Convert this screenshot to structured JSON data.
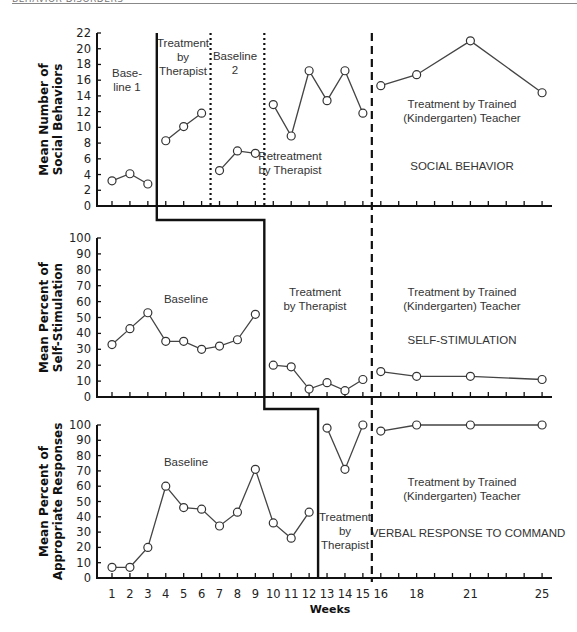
{
  "page": {
    "running_header": "BEHAVIOR DISORDERS"
  },
  "chart_data": {
    "type": "line",
    "layout": "multiple-baseline, three vertically stacked panels sharing the x-axis",
    "xlabel": "Weeks",
    "x_tick_labels": [
      "1",
      "2",
      "3",
      "4",
      "5",
      "6",
      "7",
      "8",
      "9",
      "10",
      "11",
      "12",
      "13",
      "14",
      "15",
      "16",
      "18",
      "21",
      "25"
    ],
    "x_range": [
      0,
      26
    ],
    "x_axis_ticks": [
      1,
      2,
      3,
      4,
      5,
      6,
      7,
      8,
      9,
      10,
      11,
      12,
      13,
      14,
      15,
      16,
      17,
      18,
      19,
      20,
      21,
      22,
      23,
      24,
      25
    ],
    "phase_change_week_dashed": 15.5,
    "panels": [
      {
        "id": "social",
        "ylabel": [
          "Mean Number of",
          "Social Behaviors"
        ],
        "ylim": [
          0,
          22
        ],
        "yticks": [
          0,
          2,
          4,
          6,
          8,
          10,
          12,
          14,
          16,
          18,
          20,
          22
        ],
        "panel_title": "SOCIAL BEHAVIOR",
        "segments": [
          {
            "x": [
              1,
              2,
              3
            ],
            "y": [
              3.2,
              4.1,
              2.8
            ]
          },
          {
            "x": [
              4,
              5,
              6
            ],
            "y": [
              8.3,
              10.1,
              11.8
            ]
          },
          {
            "x": [
              7,
              8,
              9
            ],
            "y": [
              4.5,
              7.0,
              6.7
            ]
          },
          {
            "x": [
              10,
              11,
              12,
              13,
              14,
              15
            ],
            "y": [
              12.9,
              8.9,
              17.2,
              13.4,
              17.2,
              11.8
            ]
          },
          {
            "x": [
              16,
              18,
              21,
              25
            ],
            "y": [
              15.3,
              16.7,
              21.0,
              14.4
            ]
          }
        ],
        "dotted_dividers_week": [
          6.5,
          9.5
        ],
        "phase_labels": [
          {
            "lines": [
              "Base-",
              "line 1"
            ]
          },
          {
            "lines": [
              "Treatment",
              "by",
              "Therapist"
            ]
          },
          {
            "lines": [
              "Baseline",
              "2"
            ]
          },
          {
            "lines": [
              "Retreatment",
              "by Therapist"
            ]
          },
          {
            "lines": [
              "Treatment by Trained",
              "(Kindergarten) Teacher"
            ]
          }
        ]
      },
      {
        "id": "selfstim",
        "ylabel": [
          "Mean Percent of",
          "Self-Stimulation"
        ],
        "ylim": [
          0,
          100
        ],
        "yticks": [
          0,
          10,
          20,
          30,
          40,
          50,
          60,
          70,
          80,
          90,
          100
        ],
        "panel_title": "SELF-STIMULATION",
        "segments": [
          {
            "x": [
              1,
              2,
              3,
              4,
              5,
              6,
              7,
              8,
              9
            ],
            "y": [
              33,
              43,
              53,
              35,
              35,
              30,
              32,
              36,
              52
            ]
          },
          {
            "x": [
              10,
              11,
              12,
              13,
              14,
              15
            ],
            "y": [
              20,
              19,
              5,
              9,
              4,
              11
            ]
          },
          {
            "x": [
              16,
              18,
              21,
              25
            ],
            "y": [
              16,
              13,
              13,
              11
            ]
          }
        ],
        "phase_labels": [
          {
            "lines": [
              "Baseline"
            ]
          },
          {
            "lines": [
              "Treatment",
              "by Therapist"
            ]
          },
          {
            "lines": [
              "Treatment by Trained",
              "(Kindergarten) Teacher"
            ]
          }
        ]
      },
      {
        "id": "verbal",
        "ylabel": [
          "Mean Percent of",
          "Appropriate Responses"
        ],
        "ylim": [
          0,
          100
        ],
        "yticks": [
          0,
          10,
          20,
          30,
          40,
          50,
          60,
          70,
          80,
          90,
          100
        ],
        "panel_title": "VERBAL RESPONSE TO COMMAND",
        "segments": [
          {
            "x": [
              1,
              2,
              3,
              4,
              5,
              6,
              7,
              8,
              9,
              10,
              11,
              12
            ],
            "y": [
              7,
              7,
              20,
              60,
              46,
              45,
              34,
              43,
              71,
              36,
              26,
              43
            ]
          },
          {
            "x": [
              13,
              14,
              15
            ],
            "y": [
              98,
              71,
              100
            ]
          },
          {
            "x": [
              16,
              18,
              21,
              25
            ],
            "y": [
              96,
              100,
              100,
              100
            ]
          }
        ],
        "phase_labels": [
          {
            "lines": [
              "Baseline"
            ]
          },
          {
            "lines": [
              "Treatment",
              "by",
              "Therapist"
            ]
          },
          {
            "lines": [
              "Treatment by Trained",
              "(Kindergarten) Teacher"
            ]
          }
        ]
      }
    ],
    "staircase_phase_line_weeks": [
      3.5,
      9.5,
      12.5
    ]
  }
}
